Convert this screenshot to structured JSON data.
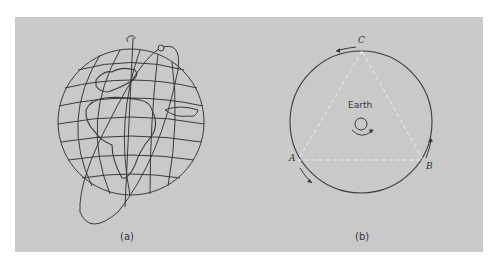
{
  "figure": {
    "panel_a": {
      "caption": "(a)",
      "subject": "globe-with-inclined-elliptical-orbit"
    },
    "panel_b": {
      "caption": "(b)",
      "center_label": "Earth",
      "satellite_labels": {
        "a": "A",
        "b": "B",
        "c": "C"
      }
    }
  },
  "colors": {
    "background": "#ffffff",
    "panel": "#c9c9c9",
    "line": "#3a3a3a",
    "triangle_dash": "#f2f2f2"
  }
}
